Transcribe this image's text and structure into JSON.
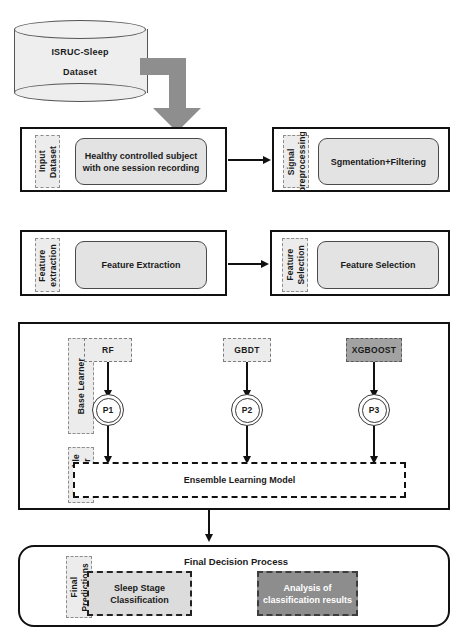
{
  "diagram": {
    "dataset": {
      "name_line1": "ISRUC-Sleep",
      "name_line2": "Dataset"
    },
    "stage_input": {
      "side_label": "Input Dataset",
      "process": "Healthy controlled subject\nwith one session recording"
    },
    "stage_preprocessing": {
      "side_label": "Signal\npreprocessing",
      "process": "Sgmentation+Filtering"
    },
    "stage_feature_extraction": {
      "side_label": "Feature\nextraction",
      "process": "Feature Extraction"
    },
    "stage_feature_selection": {
      "side_label": "Feature\nSelection",
      "process": "Feature Selection"
    },
    "stage_base_learner": {
      "side_label": "Base Learner",
      "models": [
        {
          "name": "RF",
          "prediction": "P1"
        },
        {
          "name": "GBDT",
          "prediction": "P2"
        },
        {
          "name": "XGBOOST",
          "prediction": "P3"
        }
      ]
    },
    "stage_ensemble_learner": {
      "side_label": "Ensemble\nLearner",
      "model": "Ensemble Learning Model"
    },
    "stage_final": {
      "side_label": "Final\nPredictions",
      "title": "Final Decision Process",
      "output_light": "Sleep Stage\nClassification",
      "output_dark": "Analysis of\nclassification results"
    },
    "colors": {
      "outline": "#111111",
      "process_fill": "#e3e3e3",
      "label_fill": "#ececec",
      "arrow_gray": "#8e8e8e",
      "highlight_dark": "#8d8d8d",
      "model_dark": "#a2a2a2"
    }
  }
}
